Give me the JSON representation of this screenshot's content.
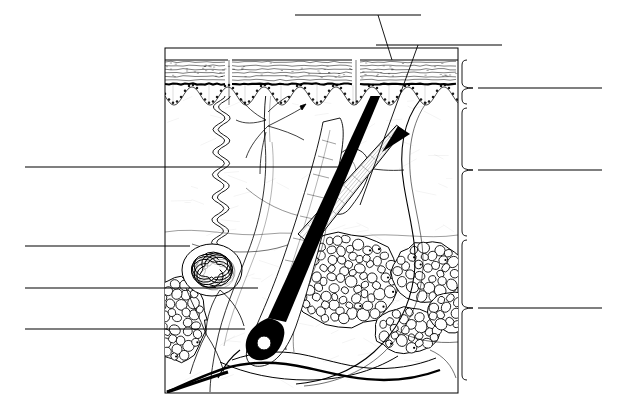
{
  "figure": {
    "title": "",
    "kind": "anatomical-cross-section",
    "background_color": "#ffffff",
    "ink_color": "#000000",
    "canvas": {
      "width": 627,
      "height": 413
    }
  },
  "frame": {
    "name": "specimen-box",
    "left": 165,
    "top": 48,
    "right": 458,
    "bottom": 393,
    "stroke": "#000000",
    "stroke_width": 1
  },
  "leader_lines": {
    "top": [
      {
        "id": "top-1",
        "name": "leader-line-top-hair-shaft",
        "x1": 295,
        "y1": 15,
        "x2": 421,
        "y2": 15,
        "connector": {
          "x1": 378,
          "y1": 15,
          "x2": 392,
          "y2": 60
        }
      },
      {
        "id": "top-2",
        "name": "leader-line-top-arrector-pili",
        "x1": 376,
        "y1": 45,
        "x2": 502,
        "y2": 45,
        "connector": {
          "x1": 418,
          "y1": 45,
          "x2": 360,
          "y2": 205
        }
      }
    ],
    "left": [
      {
        "id": "left-1",
        "name": "leader-line-left-dermis",
        "x1": 25,
        "y1": 167,
        "x2": 338,
        "y2": 167
      },
      {
        "id": "left-2",
        "name": "leader-line-left-sweat-gland",
        "x1": 25,
        "y1": 246,
        "x2": 190,
        "y2": 246
      },
      {
        "id": "left-3",
        "name": "leader-line-left-adipose",
        "x1": 25,
        "y1": 288,
        "x2": 258,
        "y2": 288
      },
      {
        "id": "left-4",
        "name": "leader-line-left-hair-bulb",
        "x1": 25,
        "y1": 329,
        "x2": 245,
        "y2": 329
      }
    ],
    "right": [
      {
        "id": "right-1",
        "name": "leader-line-right-epidermis",
        "x1": 478,
        "y1": 88,
        "x2": 602,
        "y2": 88
      },
      {
        "id": "right-2",
        "name": "leader-line-right-dermis",
        "x1": 478,
        "y1": 170,
        "x2": 602,
        "y2": 170
      },
      {
        "id": "right-3",
        "name": "leader-line-right-hypodermis",
        "x1": 478,
        "y1": 308,
        "x2": 602,
        "y2": 308
      }
    ]
  },
  "braces": [
    {
      "id": "brace-1",
      "name": "brace-epidermis",
      "top": 60,
      "bottom": 104,
      "tip_y": 88,
      "x": 462,
      "tip_x": 473
    },
    {
      "id": "brace-2",
      "name": "brace-dermis",
      "top": 108,
      "bottom": 236,
      "tip_y": 170,
      "x": 462,
      "tip_x": 473
    },
    {
      "id": "brace-3",
      "name": "brace-hypodermis",
      "top": 240,
      "bottom": 380,
      "tip_y": 308,
      "x": 462,
      "tip_x": 473
    }
  ],
  "epidermis": {
    "name": "epidermis-band",
    "top": 60,
    "corneum_bottom": 80,
    "basal_line_y": 84,
    "papillae_amplitude": 9,
    "papillae_period": 36,
    "papillae_baseline": 96,
    "stripe_count": 6,
    "segments": [
      {
        "x1": 165,
        "x2": 228
      },
      {
        "x1": 232,
        "x2": 352
      },
      {
        "x1": 360,
        "x2": 458
      }
    ]
  },
  "hair": {
    "name": "hair-shaft",
    "emerges_at": {
      "x": 393,
      "y": 12
    },
    "bulb_at": {
      "x": 258,
      "y": 345
    },
    "shaft_width_top": 6,
    "shaft_width_bottom": 11,
    "color": "#000000",
    "second_hair": {
      "name": "hair-shaft-lower",
      "from": {
        "x": 172,
        "y": 390
      },
      "to": {
        "x": 330,
        "y": 352
      }
    }
  },
  "sweat_gland": {
    "name": "eccrine-sweat-gland",
    "coil_center": {
      "x": 212,
      "y": 270
    },
    "coil_rx": 30,
    "coil_ry": 26,
    "duct_top": {
      "x": 222,
      "y": 90
    },
    "duct_waves": 7
  },
  "sebaceous_gland": {
    "name": "sebaceous-gland",
    "center": {
      "x": 345,
      "y": 180
    },
    "rx": 22,
    "ry": 30
  },
  "arrector_pili": {
    "name": "arrector-pili-muscle",
    "from": {
      "x": 305,
      "y": 240
    },
    "to": {
      "x": 400,
      "y": 128
    },
    "band_width": 16,
    "striation_count": 11
  },
  "nerve": {
    "name": "sensory-nerve-branches",
    "stem_top": {
      "x": 268,
      "y": 90
    },
    "branch_y": 140
  },
  "adipose_lobules": [
    {
      "name": "adipose-lobule-large",
      "cx": 345,
      "cy": 280,
      "rx": 55,
      "ry": 47,
      "cells": 78
    },
    {
      "name": "adipose-lobule-right-upper",
      "cx": 428,
      "cy": 272,
      "rx": 36,
      "ry": 30,
      "cells": 40
    },
    {
      "name": "adipose-lobule-right-lower",
      "cx": 408,
      "cy": 330,
      "rx": 34,
      "ry": 23,
      "cells": 32
    },
    {
      "name": "adipose-lobule-far-right",
      "cx": 452,
      "cy": 312,
      "rx": 25,
      "ry": 20,
      "cells": 22
    },
    {
      "name": "adipose-lobule-left",
      "cx": 178,
      "cy": 320,
      "rx": 28,
      "ry": 42,
      "cells": 40
    }
  ],
  "vessels": {
    "name": "blood-vessel-network",
    "color": "#000000"
  },
  "labels": {
    "visible": false,
    "note": "All label text areas are blank ruled lines (worksheet for student annotation)"
  }
}
